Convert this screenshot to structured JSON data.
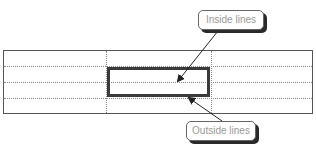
{
  "diagram": {
    "type": "table-border-illustration",
    "table": {
      "rows": 4,
      "columns": 3
    },
    "highlighted_range": {
      "column": 2,
      "rows": [
        2,
        3
      ]
    },
    "callouts": {
      "inside": {
        "label": "Inside lines"
      },
      "outside": {
        "label": "Outside lines"
      }
    },
    "colors": {
      "outer_border": "#555555",
      "inner_gridlines": "#8a8a8a",
      "highlight_border": "#3a3a3a",
      "callout_text": "#9a9a9a",
      "callout_shadow": "#2a2a2a"
    }
  }
}
